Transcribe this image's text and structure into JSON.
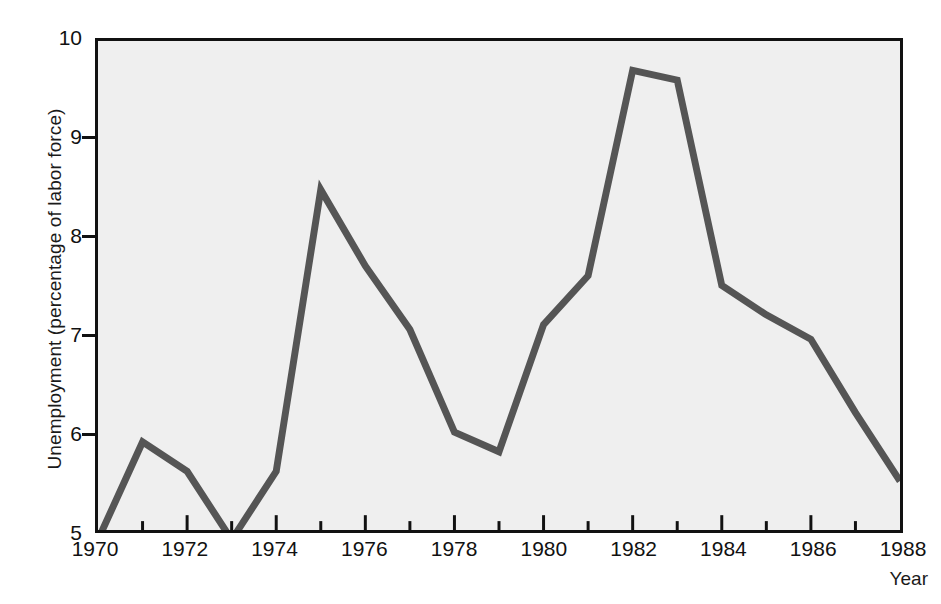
{
  "chart_data": {
    "type": "line",
    "title": "",
    "xlabel": "Year",
    "ylabel": "Unemployment (percentage of labor force)",
    "xlim": [
      1970,
      1988
    ],
    "ylim": [
      5,
      10
    ],
    "grid": false,
    "legend": null,
    "x_tick_labels": [
      "1970",
      "1972",
      "1974",
      "1976",
      "1978",
      "1980",
      "1982",
      "1984",
      "1986",
      "1988"
    ],
    "x_tick_values": [
      1970,
      1972,
      1974,
      1976,
      1978,
      1980,
      1982,
      1984,
      1986,
      1988
    ],
    "x_minor_ticks": [
      1971,
      1973,
      1975,
      1977,
      1979,
      1981,
      1983,
      1985,
      1987
    ],
    "y_tick_labels": [
      "5",
      "6",
      "7",
      "8",
      "9",
      "10"
    ],
    "y_tick_values": [
      5,
      6,
      7,
      8,
      9,
      10
    ],
    "x": [
      1970,
      1971,
      1972,
      1973,
      1974,
      1975,
      1976,
      1977,
      1978,
      1979,
      1980,
      1981,
      1982,
      1983,
      1984,
      1985,
      1986,
      1987,
      1988
    ],
    "values": [
      4.9,
      5.9,
      5.6,
      4.9,
      5.6,
      8.48,
      7.7,
      7.05,
      6.0,
      5.8,
      7.1,
      7.6,
      9.7,
      9.6,
      7.5,
      7.2,
      6.95,
      6.2,
      5.5
    ],
    "series": [
      {
        "name": "Unemployment rate",
        "values": [
          4.9,
          5.9,
          5.6,
          4.9,
          5.6,
          8.48,
          7.7,
          7.05,
          6.0,
          5.8,
          7.1,
          7.6,
          9.7,
          9.6,
          7.5,
          7.2,
          6.95,
          6.2,
          5.5
        ]
      }
    ],
    "line_color": "#555555",
    "plot_background": "#efefef",
    "frame_color": "#111111",
    "page_background": "#ffffff"
  }
}
